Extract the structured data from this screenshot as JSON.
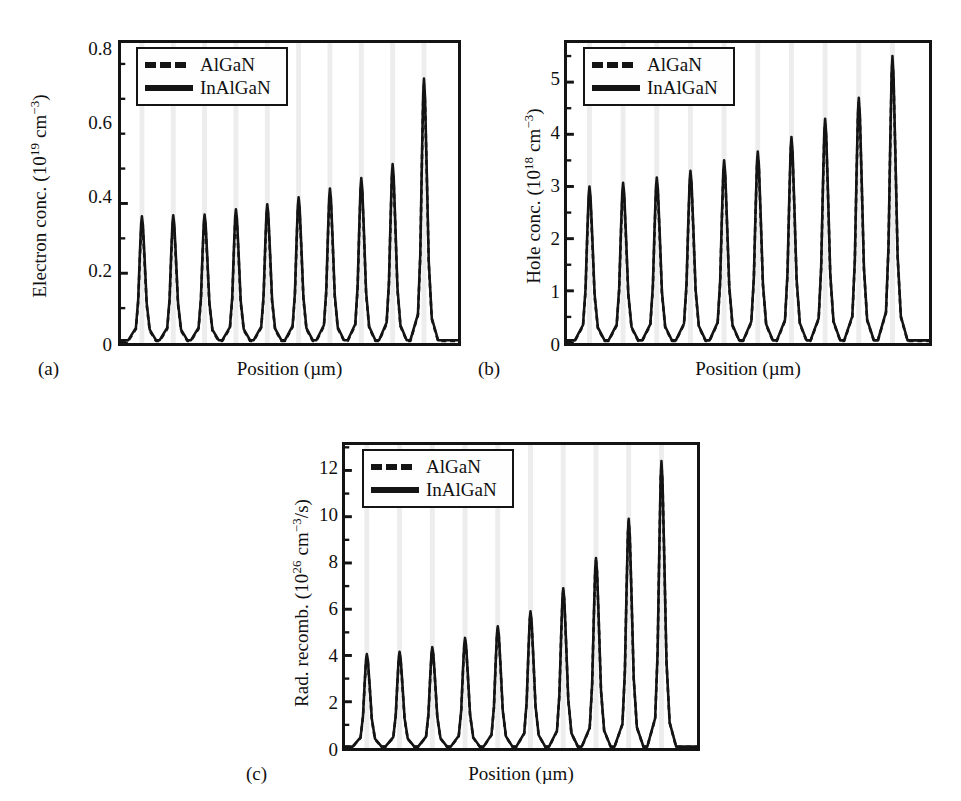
{
  "figure": {
    "background": "#ffffff",
    "line_color": "#141414",
    "well_band_color": "#ededed"
  },
  "panels": [
    {
      "tag": "(a)",
      "xlabel": "Position (µm)",
      "ylabel_main": "Electron conc. (10",
      "ylabel_exp1": "19",
      "ylabel_mid": " cm",
      "ylabel_exp2": "−3",
      "ylabel_end": ")",
      "yticks": [
        "0",
        "0.2",
        "0.4",
        "0.6",
        "0.8"
      ]
    },
    {
      "tag": "(b)",
      "xlabel": "Position (µm)",
      "ylabel_main": "Hole conc. (10",
      "ylabel_exp1": "18",
      "ylabel_mid": " cm",
      "ylabel_exp2": "−3",
      "ylabel_end": ")",
      "yticks": [
        "0",
        "1",
        "2",
        "3",
        "4",
        "5"
      ]
    },
    {
      "tag": "(c)",
      "xlabel": "Position (µm)",
      "ylabel_main": "Rad. recomb. (10",
      "ylabel_exp1": "26",
      "ylabel_mid": " cm",
      "ylabel_exp2": "−3",
      "ylabel_end": "/s)",
      "yticks": [
        "0",
        "2",
        "4",
        "6",
        "8",
        "10",
        "12"
      ]
    }
  ],
  "legend": {
    "entries": [
      {
        "label": "AlGaN",
        "style": "dashed"
      },
      {
        "label": "InAlGaN",
        "style": "solid"
      }
    ]
  },
  "chart_data": [
    {
      "type": "line",
      "panel": "(a)",
      "title": "",
      "xlabel": "Position (µm)",
      "ylabel": "Electron conc. (10^19 cm^-3)",
      "ylim": [
        0,
        0.86
      ],
      "yticks": [
        0,
        0.2,
        0.4,
        0.6,
        0.8
      ],
      "xlim": [
        0,
        10
      ],
      "grid": false,
      "legend_position": "upper-left",
      "quantum_well_positions": [
        0.62,
        1.55,
        2.48,
        3.41,
        4.34,
        5.27,
        6.2,
        7.13,
        8.06,
        8.99
      ],
      "series": [
        {
          "name": "InAlGaN",
          "style": "solid",
          "peak_positions": [
            0.62,
            1.55,
            2.48,
            3.41,
            4.34,
            5.27,
            6.2,
            7.13,
            8.06,
            8.99
          ],
          "peak_values": [
            0.355,
            0.358,
            0.36,
            0.375,
            0.39,
            0.41,
            0.435,
            0.465,
            0.505,
            0.75
          ],
          "baseline": 0.008
        },
        {
          "name": "AlGaN",
          "style": "dashed",
          "peak_positions": [
            0.62,
            1.55,
            2.48,
            3.41,
            4.34,
            5.27,
            6.2,
            7.13,
            8.06,
            8.99
          ],
          "peak_values": [
            0.34,
            0.344,
            0.348,
            0.362,
            0.378,
            0.398,
            0.422,
            0.452,
            0.492,
            0.735
          ],
          "baseline": 0.006
        }
      ]
    },
    {
      "type": "line",
      "panel": "(b)",
      "title": "",
      "xlabel": "Position (µm)",
      "ylabel": "Hole conc. (10^18 cm^-3)",
      "ylim": [
        0,
        5.75
      ],
      "yticks": [
        0,
        1,
        2,
        3,
        4,
        5
      ],
      "xlim": [
        0,
        10
      ],
      "grid": false,
      "legend_position": "upper-left",
      "quantum_well_positions": [
        0.62,
        1.55,
        2.48,
        3.41,
        4.34,
        5.27,
        6.2,
        7.13,
        8.06,
        8.99
      ],
      "series": [
        {
          "name": "InAlGaN",
          "style": "solid",
          "peak_positions": [
            0.62,
            1.55,
            2.48,
            3.41,
            4.34,
            5.27,
            6.2,
            7.13,
            8.06,
            8.99
          ],
          "peak_values": [
            2.95,
            3.02,
            3.12,
            3.25,
            3.45,
            3.62,
            3.9,
            4.25,
            4.65,
            5.45
          ],
          "baseline": 0.05
        },
        {
          "name": "AlGaN",
          "style": "dashed",
          "peak_positions": [
            0.62,
            1.55,
            2.48,
            3.41,
            4.34,
            5.27,
            6.2,
            7.13,
            8.06,
            8.99
          ],
          "peak_values": [
            2.85,
            2.92,
            3.02,
            3.16,
            3.36,
            3.54,
            3.82,
            4.17,
            4.57,
            5.38
          ],
          "baseline": 0.04
        }
      ]
    },
    {
      "type": "line",
      "panel": "(c)",
      "title": "",
      "xlabel": "Position (µm)",
      "ylabel": "Rad. recomb. (10^26 cm^-3/s)",
      "ylim": [
        0,
        13.1
      ],
      "yticks": [
        0,
        2,
        4,
        6,
        8,
        10,
        12
      ],
      "xlim": [
        0,
        10
      ],
      "grid": false,
      "legend_position": "upper-left",
      "quantum_well_positions": [
        0.62,
        1.55,
        2.48,
        3.41,
        4.34,
        5.27,
        6.2,
        7.13,
        8.06,
        8.99
      ],
      "series": [
        {
          "name": "InAlGaN",
          "style": "solid",
          "peak_positions": [
            0.62,
            1.55,
            2.48,
            3.41,
            4.34,
            5.27,
            6.2,
            7.13,
            8.06,
            8.99
          ],
          "peak_values": [
            4.0,
            4.1,
            4.3,
            4.7,
            5.2,
            5.85,
            6.85,
            8.15,
            9.85,
            12.35
          ],
          "baseline": 0.06
        },
        {
          "name": "AlGaN",
          "style": "dashed",
          "peak_positions": [
            0.62,
            1.55,
            2.48,
            3.41,
            4.34,
            5.27,
            6.2,
            7.13,
            8.06,
            8.99
          ],
          "peak_values": [
            3.9,
            4.0,
            4.2,
            4.6,
            5.1,
            5.75,
            6.75,
            8.05,
            9.75,
            12.2
          ],
          "baseline": 0.05
        }
      ]
    }
  ]
}
